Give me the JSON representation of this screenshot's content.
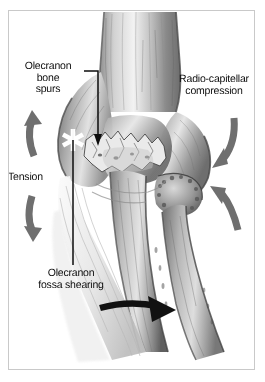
{
  "figure": {
    "background_color": "#ffffff",
    "frame_color": "#c9c9c9",
    "text_color": "#0d0d0d",
    "arrow_gray": "#6f6f6f",
    "arrow_black": "#111111",
    "marker_white": "#ffffff"
  },
  "labels": {
    "olecranon_spurs": "Olecranon\nbone\nspurs",
    "radio_capitellar": "Radio-capitellar\ncompression",
    "tension": "Tension",
    "fossa_shearing": "Olecranon\nfossa shearing"
  },
  "markers": {
    "asterisk": "asterisk-marker"
  },
  "arrows": [
    {
      "name": "tension-arrow-up",
      "color": "#6f6f6f",
      "direction": "up",
      "side": "left"
    },
    {
      "name": "tension-arrow-down",
      "color": "#6f6f6f",
      "direction": "down",
      "side": "left"
    },
    {
      "name": "compression-arrow-upper",
      "color": "#6f6f6f",
      "direction": "down-left",
      "side": "right"
    },
    {
      "name": "compression-arrow-lower",
      "color": "#6f6f6f",
      "direction": "up-left",
      "side": "right"
    },
    {
      "name": "shearing-arrow",
      "color": "#111111",
      "direction": "right",
      "side": "bottom"
    }
  ],
  "anatomy": [
    {
      "name": "humerus",
      "label": "Humerus (distal shaft)"
    },
    {
      "name": "medial-epicondyle",
      "label": "Medial epicondyle"
    },
    {
      "name": "olecranon",
      "label": "Olecranon process with bone spurs"
    },
    {
      "name": "olecranon-fossa",
      "label": "Olecranon fossa"
    },
    {
      "name": "radial-head",
      "label": "Radial head / capitellum"
    },
    {
      "name": "ulna",
      "label": "Ulna"
    },
    {
      "name": "radius",
      "label": "Radius"
    }
  ]
}
